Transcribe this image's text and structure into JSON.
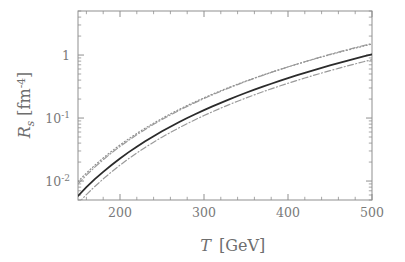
{
  "chart_data": {
    "type": "line",
    "title": "",
    "subtitle": "",
    "xlabel": "T  [GeV]",
    "xlabel_symbol": "T",
    "xlabel_unit": "[GeV]",
    "ylabel": "R_s  [fm^-4]",
    "ylabel_symbol": "R",
    "ylabel_subscript": "s",
    "ylabel_unit_open": "[fm",
    "ylabel_unit_exp": "-4",
    "ylabel_unit_close": "]",
    "xscale": "linear",
    "yscale": "log",
    "xlim": [
      150,
      500
    ],
    "ylim": [
      0.005,
      5.0
    ],
    "grid": false,
    "legend": null,
    "legend_position": "none",
    "xticks": [
      200,
      300,
      400,
      500
    ],
    "xtick_labels": [
      "200",
      "300",
      "400",
      "500"
    ],
    "yticks": [
      1,
      0.1,
      0.01
    ],
    "ytick_labels": [
      "1",
      "10",
      "10",
      "10"
    ],
    "ytick_label_parts": [
      {
        "mantissa": "1",
        "exponent": ""
      },
      {
        "mantissa": "10",
        "exponent": "-1"
      },
      {
        "mantissa": "10",
        "exponent": "-2"
      }
    ],
    "x": [
      150,
      160,
      170,
      180,
      190,
      200,
      210,
      220,
      230,
      240,
      250,
      260,
      270,
      280,
      290,
      300,
      310,
      320,
      330,
      340,
      350,
      360,
      370,
      380,
      390,
      400,
      410,
      420,
      430,
      440,
      450,
      460,
      470,
      480,
      490,
      500
    ],
    "series": [
      {
        "name": "solid",
        "style": "solid",
        "color": "#2b2b2b",
        "width": 1.8,
        "values": [
          0.0058,
          0.008,
          0.0107,
          0.014,
          0.018,
          0.0228,
          0.0285,
          0.0351,
          0.0427,
          0.0515,
          0.0615,
          0.0728,
          0.0856,
          0.0999,
          0.1158,
          0.1335,
          0.153,
          0.1745,
          0.198,
          0.2237,
          0.2517,
          0.282,
          0.3149,
          0.3504,
          0.3886,
          0.4297,
          0.4738,
          0.521,
          0.5714,
          0.6252,
          0.6824,
          0.7433,
          0.8079,
          0.8764,
          0.9489,
          1.0255
        ]
      },
      {
        "name": "dotted",
        "style": "dotted",
        "color": "#8c8c8c",
        "width": 1.2,
        "values": [
          0.0098,
          0.0134,
          0.0178,
          0.0232,
          0.0297,
          0.0374,
          0.0465,
          0.057,
          0.0691,
          0.0829,
          0.0986,
          0.1163,
          0.136,
          0.1581,
          0.1825,
          0.2094,
          0.239,
          0.2714,
          0.3067,
          0.3451,
          0.3867,
          0.4316,
          0.4801,
          0.5322,
          0.5881,
          0.6479,
          0.7118,
          0.7799,
          0.8524,
          0.9294,
          1.0111,
          1.0976,
          1.1891,
          1.2857,
          1.3876,
          1.4949
        ]
      },
      {
        "name": "dash-dot-upper",
        "style": "dash-dot",
        "color": "#9a9a9a",
        "width": 1.2,
        "values": [
          0.009,
          0.0124,
          0.0166,
          0.0218,
          0.028,
          0.0354,
          0.0441,
          0.0543,
          0.066,
          0.0794,
          0.0947,
          0.112,
          0.1314,
          0.1531,
          0.1772,
          0.2039,
          0.2334,
          0.2658,
          0.3012,
          0.3398,
          0.3818,
          0.4273,
          0.4765,
          0.5296,
          0.5867,
          0.648,
          0.7136,
          0.7838,
          0.8587,
          0.9384,
          1.0232,
          1.1132,
          1.2086,
          1.3096,
          1.4164,
          1.5291
        ]
      },
      {
        "name": "dash-dot-lower",
        "style": "dash-dot",
        "color": "#9a9a9a",
        "width": 1.2,
        "values": [
          0.0044,
          0.0061,
          0.0082,
          0.0108,
          0.014,
          0.0179,
          0.0225,
          0.0279,
          0.0342,
          0.0414,
          0.0497,
          0.0591,
          0.0697,
          0.0816,
          0.0949,
          0.1096,
          0.1259,
          0.1438,
          0.1634,
          0.1849,
          0.2082,
          0.2335,
          0.2609,
          0.2904,
          0.3222,
          0.3563,
          0.3928,
          0.4318,
          0.4734,
          0.5177,
          0.5648,
          0.6147,
          0.6676,
          0.7235,
          0.7826,
          0.8449
        ]
      }
    ]
  },
  "figure": {
    "background_color": "#ffffff",
    "frame_color": "#8f8f8f",
    "tick_color": "#8f8f8f",
    "text_color": "#6e6e6e"
  }
}
